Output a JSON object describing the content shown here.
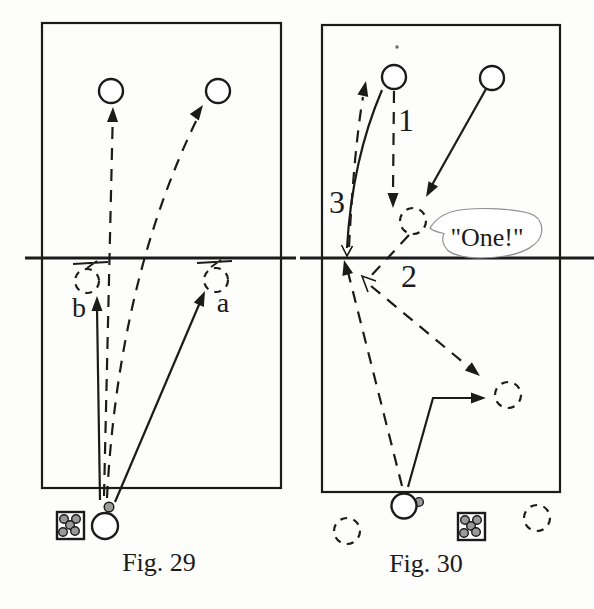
{
  "colors": {
    "ink": "#1b1b1b",
    "paper": "#fdfdfc",
    "ball-fill": "#9a9a9a",
    "bubble-stroke": "#8f8f8f"
  },
  "fig29": {
    "caption": "Fig. 29",
    "label_b": "b",
    "label_a": "a"
  },
  "fig30": {
    "caption": "Fig. 30",
    "label_1": "1",
    "label_2": "2",
    "label_3": "3",
    "speech": "\"One!\""
  }
}
